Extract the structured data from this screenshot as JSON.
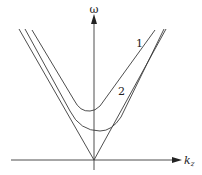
{
  "diagram": {
    "type": "dispersion-relation",
    "axes": {
      "y_label": "ω",
      "x_label": "k",
      "x_label_subscript": "z"
    },
    "curves": [
      {
        "id": "1",
        "label": "1",
        "description": "upper hyperbolic branch"
      },
      {
        "id": "2",
        "label": "2",
        "description": "lower hyperbolic branch"
      },
      {
        "id": "asymptote",
        "label": "",
        "description": "light-cone asymptote lines through origin"
      }
    ],
    "colors": {
      "line": "#3a3a3a",
      "background": "#ffffff"
    }
  }
}
